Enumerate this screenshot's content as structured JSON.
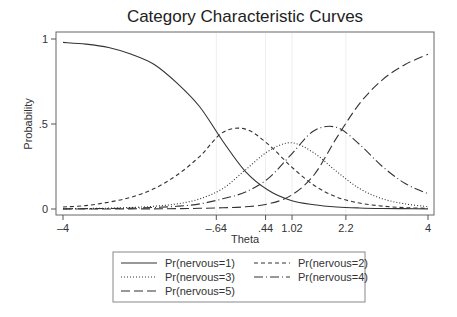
{
  "chart_data": {
    "type": "line",
    "title": "Category Characteristic Curves",
    "xlabel": "Theta",
    "ylabel": "Probability",
    "xlim": [
      -4,
      4
    ],
    "ylim": [
      0,
      1
    ],
    "x_ticks": [
      -4,
      -0.64,
      0.44,
      1.02,
      2.2,
      4
    ],
    "x_tick_labels": [
      "-4",
      "-.64",
      ".44",
      "1.02",
      "2.2",
      "4"
    ],
    "y_ticks": [
      0,
      0.5,
      1
    ],
    "y_tick_labels": [
      "0",
      ".5",
      "1"
    ],
    "grid": "faint vertical lines at inner x ticks",
    "legend_position": "bottom",
    "x": [
      -4,
      -3.5,
      -3,
      -2.5,
      -2,
      -1.5,
      -1,
      -0.5,
      0,
      0.5,
      1,
      1.5,
      2,
      2.5,
      3,
      3.5,
      4
    ],
    "series": [
      {
        "name": "Pr(nervous=1)",
        "style": "solid",
        "values": [
          0.98,
          0.97,
          0.95,
          0.91,
          0.85,
          0.74,
          0.6,
          0.4,
          0.22,
          0.11,
          0.05,
          0.025,
          0.012,
          0.006,
          0.003,
          0.002,
          0.001
        ]
      },
      {
        "name": "Pr(nervous=2)",
        "style": "short-dash",
        "values": [
          0.012,
          0.02,
          0.04,
          0.07,
          0.12,
          0.2,
          0.31,
          0.45,
          0.47,
          0.38,
          0.25,
          0.14,
          0.07,
          0.035,
          0.017,
          0.008,
          0.004
        ]
      },
      {
        "name": "Pr(nervous=3)",
        "style": "dotted",
        "values": [
          0.002,
          0.003,
          0.005,
          0.009,
          0.016,
          0.03,
          0.06,
          0.12,
          0.23,
          0.34,
          0.39,
          0.33,
          0.22,
          0.12,
          0.06,
          0.03,
          0.014
        ]
      },
      {
        "name": "Pr(nervous=4)",
        "style": "long-dash-dot",
        "values": [
          0.001,
          0.002,
          0.003,
          0.005,
          0.009,
          0.016,
          0.03,
          0.06,
          0.1,
          0.18,
          0.32,
          0.46,
          0.48,
          0.38,
          0.25,
          0.15,
          0.09
        ]
      },
      {
        "name": "Pr(nervous=5)",
        "style": "long-dash",
        "values": [
          0.0,
          0.0,
          0.0,
          0.001,
          0.001,
          0.002,
          0.004,
          0.007,
          0.013,
          0.03,
          0.08,
          0.2,
          0.42,
          0.62,
          0.76,
          0.85,
          0.91
        ]
      }
    ]
  },
  "legend": {
    "items": [
      "Pr(nervous=1)",
      "Pr(nervous=2)",
      "Pr(nervous=3)",
      "Pr(nervous=4)",
      "Pr(nervous=5)"
    ]
  }
}
